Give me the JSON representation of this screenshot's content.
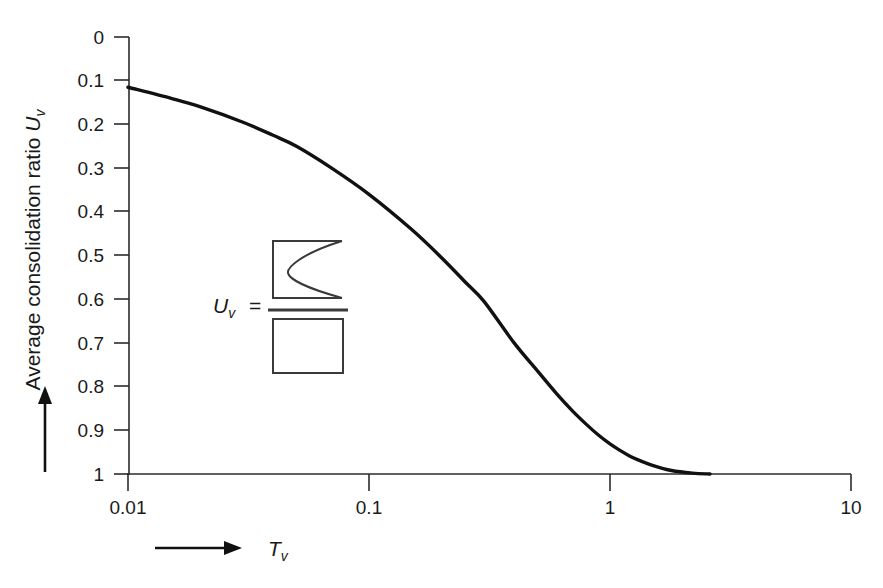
{
  "chart_data": {
    "type": "line",
    "title": "",
    "subtitle": "",
    "xlabel": "T_v",
    "xlabel_base": "T",
    "xlabel_sub": "v",
    "ylabel": "Average consolidation ratio U_v",
    "ylabel_text": "Average consolidation ratio ",
    "ylabel_base": "U",
    "ylabel_sub": "v",
    "xscale": "log",
    "xlim": [
      0.01,
      10
    ],
    "ylim": [
      0,
      1
    ],
    "y_inverted": true,
    "grid": false,
    "legend": null,
    "xtick_labels": [
      "0.01",
      "0.1",
      "1",
      "10"
    ],
    "xtick_values": [
      0.01,
      0.1,
      1,
      10
    ],
    "ytick_labels": [
      "0",
      "0.1",
      "0.2",
      "0.3",
      "0.4",
      "0.5",
      "0.6",
      "0.7",
      "0.8",
      "0.9",
      "1"
    ],
    "ytick_values": [
      0,
      0.1,
      0.2,
      0.3,
      0.4,
      0.5,
      0.6,
      0.7,
      0.8,
      0.9,
      1
    ],
    "series": [
      {
        "name": "Average consolidation ratio vs time factor",
        "x": [
          0.01,
          0.015,
          0.02,
          0.03,
          0.04,
          0.05,
          0.07,
          0.1,
          0.15,
          0.2,
          0.25,
          0.3,
          0.4,
          0.5,
          0.6,
          0.7,
          0.8,
          0.9,
          1.0,
          1.1,
          1.2,
          1.3,
          1.5,
          1.8,
          2.2,
          2.6
        ],
        "y": [
          0.115,
          0.14,
          0.16,
          0.195,
          0.225,
          0.25,
          0.3,
          0.36,
          0.44,
          0.505,
          0.56,
          0.605,
          0.7,
          0.764,
          0.816,
          0.856,
          0.887,
          0.912,
          0.931,
          0.946,
          0.958,
          0.967,
          0.98,
          0.992,
          0.998,
          1.0
        ]
      }
    ],
    "annotations": {
      "inset_formula": {
        "label": "U",
        "label_sub": "v",
        "equals": "=",
        "numerator_description": "isochrone-area-shape",
        "denominator_description": "full-rectangle-shape"
      }
    },
    "axis_arrows": {
      "y_arrow_direction": "up",
      "x_arrow_direction": "right"
    },
    "colors": {
      "curve": "#111111",
      "axis": "#2b2b2b",
      "text": "#1a1a1a",
      "inset": "#3a3a3a",
      "background": "#ffffff"
    }
  }
}
